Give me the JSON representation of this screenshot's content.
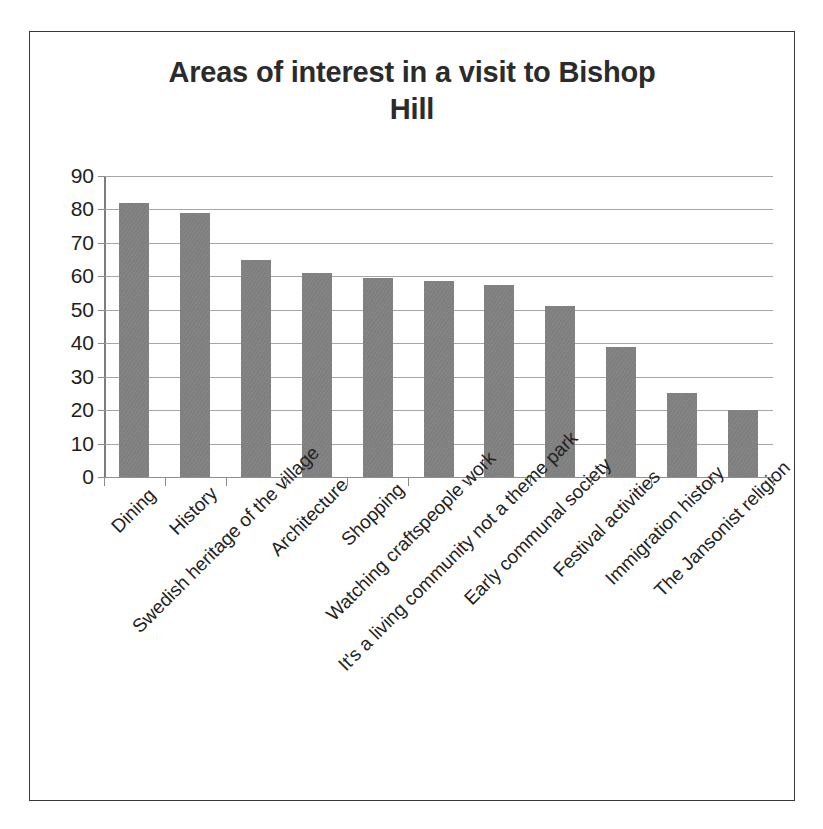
{
  "chart_data": {
    "type": "bar",
    "title": "Areas of interest in a visit to Bishop Hill",
    "title_lines": [
      "Areas of interest in a visit to Bishop",
      "Hill"
    ],
    "xlabel": "",
    "ylabel": "",
    "ylim": [
      0,
      90
    ],
    "ytick_step": 10,
    "yticks": [
      90,
      80,
      70,
      60,
      50,
      40,
      30,
      20,
      10,
      0
    ],
    "grid": true,
    "legend": false,
    "bar_color": "#7f7f7f",
    "categories": [
      "Dining",
      "History",
      "Swedish heritage of the village",
      "Architecture",
      "Shopping",
      "Watching craftspeople work",
      "It's a living community not a theme park",
      "Early communal society",
      "Festival activities",
      "Immigration history",
      "The Jansonist religion"
    ],
    "values": [
      82,
      79,
      65,
      61,
      59.5,
      58.5,
      57.5,
      51,
      39,
      25,
      20
    ]
  },
  "colors": {
    "bar": "#7f7f7f",
    "gridline": "#a6a6a6",
    "axis": "#7d7d7d",
    "title_text": "#2b2b2b",
    "tick_text": "#1e1e1e",
    "frame_border": "#3a3a3a"
  }
}
